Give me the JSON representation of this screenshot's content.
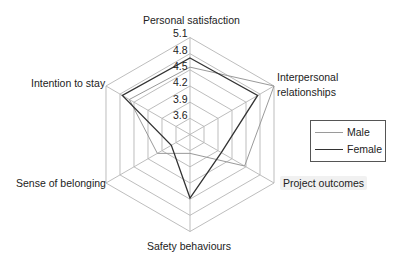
{
  "chart_data": {
    "type": "radar",
    "title": "",
    "axes": [
      "Personal satisfaction",
      "Interpersonal relationships",
      "Project outcomes",
      "Safety behaviours",
      "Sense of belonging",
      "Intention to stay"
    ],
    "ticks": [
      "3.6",
      "3.9",
      "4.2",
      "4.5",
      "4.8",
      "5.1"
    ],
    "range": [
      3.3,
      5.1
    ],
    "grid": true,
    "legend_position": "right",
    "series": [
      {
        "name": "Male",
        "color": "#9a9a9a",
        "values": [
          4.55,
          5.1,
          4.47,
          3.65,
          4.0,
          4.6
        ]
      },
      {
        "name": "Female",
        "color": "#333333",
        "values": [
          4.72,
          4.75,
          3.97,
          4.48,
          3.7,
          4.75
        ]
      }
    ]
  },
  "labels": {
    "personal": "Personal satisfaction",
    "interpersonal_1": "Interpersonal",
    "interpersonal_2": "relationships",
    "project": "Project outcomes",
    "safety": "Safety behaviours",
    "belonging": "Sense of belonging",
    "intention": "Intention to stay"
  },
  "legend": {
    "male": "Male",
    "female": "Female"
  },
  "colors": {
    "grid": "#b5b5b5",
    "male": "#9a9a9a",
    "female": "#333333"
  }
}
